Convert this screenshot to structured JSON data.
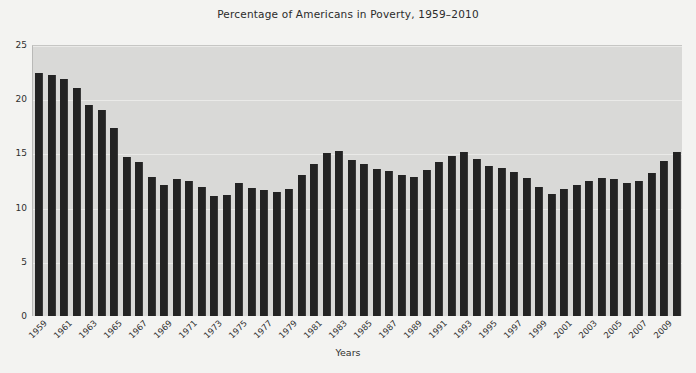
{
  "chart_data": {
    "type": "bar",
    "title": "Percentage of Americans in Poverty, 1959–2010",
    "xlabel": "Years",
    "ylabel": "",
    "ylim": [
      0,
      25
    ],
    "yticks": [
      0,
      5,
      10,
      15,
      20,
      25
    ],
    "grid": true,
    "legend": "none",
    "bar_color": "#232323",
    "plot_bg_color": "#d9d9d7",
    "figure_bg_color": "#f3f3f1",
    "xtick_step": 2,
    "xtick_labels": [
      "1959",
      "1961",
      "1963",
      "1965",
      "1967",
      "1969",
      "1971",
      "1973",
      "1975",
      "1977",
      "1979",
      "1981",
      "1983",
      "1985",
      "1987",
      "1989",
      "1991",
      "1993",
      "1995",
      "1997",
      "1999",
      "2001",
      "2003",
      "2005",
      "2007",
      "2009"
    ],
    "categories": [
      "1959",
      "1960",
      "1961",
      "1962",
      "1963",
      "1964",
      "1965",
      "1966",
      "1967",
      "1968",
      "1969",
      "1970",
      "1971",
      "1972",
      "1973",
      "1974",
      "1975",
      "1976",
      "1977",
      "1978",
      "1979",
      "1980",
      "1981",
      "1982",
      "1983",
      "1984",
      "1985",
      "1986",
      "1987",
      "1988",
      "1989",
      "1990",
      "1991",
      "1992",
      "1993",
      "1994",
      "1995",
      "1996",
      "1997",
      "1998",
      "1999",
      "2000",
      "2001",
      "2002",
      "2003",
      "2004",
      "2005",
      "2006",
      "2007",
      "2008",
      "2009",
      "2010"
    ],
    "values": [
      22.4,
      22.2,
      21.9,
      21.0,
      19.5,
      19.0,
      17.3,
      14.7,
      14.2,
      12.8,
      12.1,
      12.6,
      12.5,
      11.9,
      11.1,
      11.2,
      12.3,
      11.8,
      11.6,
      11.4,
      11.7,
      13.0,
      14.0,
      15.0,
      15.2,
      14.4,
      14.0,
      13.6,
      13.4,
      13.0,
      12.8,
      13.5,
      14.2,
      14.8,
      15.1,
      14.5,
      13.8,
      13.7,
      13.3,
      12.7,
      11.9,
      11.3,
      11.7,
      12.1,
      12.5,
      12.7,
      12.6,
      12.3,
      12.5,
      13.2,
      14.3,
      15.1
    ]
  }
}
